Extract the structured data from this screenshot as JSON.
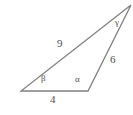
{
  "figure": {
    "type": "triangle-diagram",
    "background_color": "#ffffff",
    "stroke_color": "#808080",
    "text_color": "#4e4e4e",
    "stroke_width": 1.3,
    "vertices": {
      "bottom_left": {
        "x": 21,
        "y": 91
      },
      "bottom_right": {
        "x": 88,
        "y": 91
      },
      "top_right": {
        "x": 131,
        "y": 5
      }
    },
    "sides": [
      {
        "name": "side-9",
        "label": "9",
        "from": "bottom_left",
        "to": "top_right",
        "label_x": 57,
        "label_y": 38
      },
      {
        "name": "side-6",
        "label": "6",
        "from": "bottom_right",
        "to": "top_right",
        "label_x": 110,
        "label_y": 54
      },
      {
        "name": "side-4",
        "label": "4",
        "from": "bottom_left",
        "to": "bottom_right",
        "label_x": 50,
        "label_y": 94
      }
    ],
    "angles": [
      {
        "name": "angle-beta",
        "label": "β",
        "at": "bottom_left",
        "label_x": 41,
        "label_y": 74
      },
      {
        "name": "angle-alpha",
        "label": "α",
        "at": "bottom_right",
        "label_x": 75,
        "label_y": 75
      },
      {
        "name": "angle-gamma",
        "label": "γ",
        "at": "top_right",
        "label_x": 115,
        "label_y": 18
      }
    ],
    "labels": {
      "side_9": "9",
      "side_6": "6",
      "side_4": "4",
      "angle_beta": "β",
      "angle_alpha": "α",
      "angle_gamma": "γ"
    }
  },
  "chart_data": {
    "type": "diagram",
    "title": "",
    "shape": "triangle",
    "side_lengths": [
      9,
      6,
      4
    ],
    "side_labels": [
      "9",
      "6",
      "4"
    ],
    "angle_labels": [
      "β",
      "α",
      "γ"
    ]
  }
}
